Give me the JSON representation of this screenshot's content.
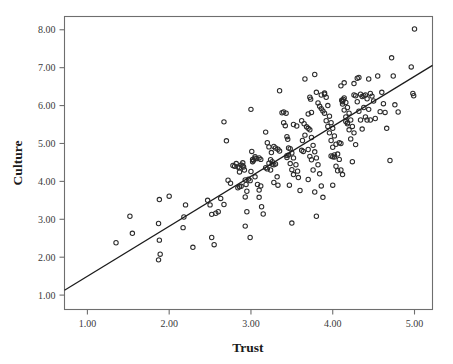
{
  "chart_data": {
    "type": "scatter",
    "title": "",
    "xlabel": "Trust",
    "ylabel": "Culture",
    "xlim": [
      0.72,
      5.22
    ],
    "ylim": [
      0.62,
      8.35
    ],
    "grid": false,
    "legend": null,
    "x_ticks": [
      "1.00",
      "2.00",
      "3.00",
      "4.00",
      "5.00"
    ],
    "x_tick_values": [
      1.0,
      2.0,
      3.0,
      4.0,
      5.0
    ],
    "y_ticks": [
      "1.00",
      "2.00",
      "3.00",
      "4.00",
      "5.00",
      "6.00",
      "7.00",
      "8.00"
    ],
    "y_tick_values": [
      1.0,
      2.0,
      3.0,
      4.0,
      5.0,
      6.0,
      7.0,
      8.0
    ],
    "marker": "open-circle",
    "marker_color": "#2b2b2b",
    "fit_line": {
      "type": "linear",
      "x_start": 0.72,
      "y_start": 1.13,
      "x_end": 5.22,
      "y_end": 7.06,
      "slope": 1.318,
      "intercept": 0.181,
      "color": "#1c1c1c"
    },
    "points": [
      [
        1.35,
        2.38
      ],
      [
        1.52,
        3.08
      ],
      [
        1.55,
        2.63
      ],
      [
        1.88,
        3.52
      ],
      [
        2.0,
        3.61
      ],
      [
        1.87,
        2.89
      ],
      [
        1.88,
        2.45
      ],
      [
        1.89,
        2.08
      ],
      [
        1.87,
        1.93
      ],
      [
        2.18,
        3.06
      ],
      [
        2.17,
        2.78
      ],
      [
        2.2,
        3.38
      ],
      [
        2.29,
        2.26
      ],
      [
        2.47,
        3.5
      ],
      [
        2.5,
        3.38
      ],
      [
        2.52,
        2.52
      ],
      [
        2.55,
        2.33
      ],
      [
        2.63,
        3.55
      ],
      [
        2.52,
        3.13
      ],
      [
        2.57,
        3.16
      ],
      [
        2.6,
        3.2
      ],
      [
        2.67,
        3.39
      ],
      [
        2.67,
        5.57
      ],
      [
        2.7,
        5.07
      ],
      [
        2.72,
        4.03
      ],
      [
        2.75,
        3.95
      ],
      [
        2.78,
        4.42
      ],
      [
        2.8,
        4.4
      ],
      [
        2.82,
        4.47
      ],
      [
        2.84,
        3.83
      ],
      [
        2.86,
        3.86
      ],
      [
        2.88,
        3.87
      ],
      [
        2.9,
        4.49
      ],
      [
        2.91,
        4.38
      ],
      [
        2.92,
        4.3
      ],
      [
        2.93,
        4.04
      ],
      [
        2.86,
        4.25
      ],
      [
        2.94,
        3.92
      ],
      [
        2.95,
        3.74
      ],
      [
        2.93,
        3.59
      ],
      [
        2.95,
        3.2
      ],
      [
        2.93,
        2.82
      ],
      [
        2.99,
        2.52
      ],
      [
        3.0,
        5.9
      ],
      [
        3.01,
        4.79
      ],
      [
        3.02,
        4.52
      ],
      [
        3.0,
        4.26
      ],
      [
        3.03,
        4.55
      ],
      [
        3.05,
        4.61
      ],
      [
        3.07,
        4.6
      ],
      [
        3.05,
        4.12
      ],
      [
        3.08,
        3.92
      ],
      [
        3.1,
        3.77
      ],
      [
        3.12,
        3.88
      ],
      [
        3.1,
        3.58
      ],
      [
        3.13,
        3.33
      ],
      [
        3.15,
        3.14
      ],
      [
        3.18,
        5.3
      ],
      [
        3.2,
        5.02
      ],
      [
        3.22,
        4.91
      ],
      [
        3.25,
        4.76
      ],
      [
        3.22,
        4.48
      ],
      [
        3.26,
        4.45
      ],
      [
        3.28,
        4.44
      ],
      [
        3.3,
        4.46
      ],
      [
        3.24,
        4.3
      ],
      [
        3.32,
        4.12
      ],
      [
        3.28,
        3.97
      ],
      [
        3.33,
        3.9
      ],
      [
        3.35,
        6.39
      ],
      [
        3.38,
        5.81
      ],
      [
        3.4,
        5.55
      ],
      [
        3.42,
        5.47
      ],
      [
        3.44,
        5.18
      ],
      [
        3.45,
        5.11
      ],
      [
        3.46,
        4.88
      ],
      [
        3.48,
        4.86
      ],
      [
        3.5,
        4.75
      ],
      [
        3.44,
        4.63
      ],
      [
        3.52,
        4.62
      ],
      [
        3.48,
        4.47
      ],
      [
        3.55,
        4.44
      ],
      [
        3.5,
        4.31
      ],
      [
        3.57,
        4.27
      ],
      [
        3.52,
        4.18
      ],
      [
        3.58,
        4.1
      ],
      [
        3.47,
        3.9
      ],
      [
        3.6,
        3.76
      ],
      [
        3.5,
        2.9
      ],
      [
        3.43,
        5.8
      ],
      [
        3.4,
        5.83
      ],
      [
        3.62,
        5.6
      ],
      [
        3.65,
        5.52
      ],
      [
        3.68,
        5.44
      ],
      [
        3.7,
        5.4
      ],
      [
        3.72,
        5.36
      ],
      [
        3.66,
        5.22
      ],
      [
        3.74,
        5.16
      ],
      [
        3.63,
        5.08
      ],
      [
        3.76,
        4.95
      ],
      [
        3.7,
        4.84
      ],
      [
        3.78,
        4.78
      ],
      [
        3.72,
        4.66
      ],
      [
        3.8,
        4.62
      ],
      [
        3.74,
        4.57
      ],
      [
        3.82,
        4.44
      ],
      [
        3.76,
        4.3
      ],
      [
        3.84,
        4.2
      ],
      [
        3.7,
        4.05
      ],
      [
        3.86,
        3.88
      ],
      [
        3.78,
        3.72
      ],
      [
        3.88,
        3.58
      ],
      [
        3.8,
        3.08
      ],
      [
        3.66,
        6.7
      ],
      [
        3.73,
        6.17
      ],
      [
        3.72,
        6.22
      ],
      [
        3.78,
        6.82
      ],
      [
        3.8,
        6.35
      ],
      [
        3.82,
        6.07
      ],
      [
        3.84,
        5.98
      ],
      [
        3.86,
        5.92
      ],
      [
        3.88,
        5.86
      ],
      [
        3.9,
        6.3
      ],
      [
        3.92,
        6.22
      ],
      [
        3.94,
        6.0
      ],
      [
        3.9,
        5.8
      ],
      [
        3.96,
        5.72
      ],
      [
        3.92,
        5.6
      ],
      [
        3.98,
        5.55
      ],
      [
        3.94,
        5.45
      ],
      [
        4.0,
        5.4
      ],
      [
        3.96,
        5.28
      ],
      [
        4.02,
        5.2
      ],
      [
        3.98,
        5.08
      ],
      [
        4.04,
        4.98
      ],
      [
        4.0,
        4.9
      ],
      [
        4.06,
        4.72
      ],
      [
        4.02,
        4.64
      ],
      [
        4.08,
        4.58
      ],
      [
        4.04,
        4.4
      ],
      [
        4.1,
        4.3
      ],
      [
        4.06,
        4.28
      ],
      [
        4.12,
        4.18
      ],
      [
        4.0,
        3.9
      ],
      [
        3.98,
        4.67
      ],
      [
        4.0,
        4.65
      ],
      [
        4.02,
        4.7
      ],
      [
        4.14,
        6.6
      ],
      [
        4.1,
        6.52
      ],
      [
        4.16,
        6.08
      ],
      [
        4.12,
        6.12
      ],
      [
        4.13,
        6.16
      ],
      [
        4.14,
        6.2
      ],
      [
        4.12,
        6.04
      ],
      [
        4.18,
        5.95
      ],
      [
        4.14,
        5.88
      ],
      [
        4.2,
        5.8
      ],
      [
        4.16,
        5.7
      ],
      [
        4.22,
        5.62
      ],
      [
        4.18,
        5.52
      ],
      [
        4.24,
        5.45
      ],
      [
        4.2,
        5.36
      ],
      [
        4.26,
        5.28
      ],
      [
        4.22,
        5.12
      ],
      [
        4.28,
        4.97
      ],
      [
        4.24,
        4.52
      ],
      [
        4.3,
        6.72
      ],
      [
        4.32,
        6.74
      ],
      [
        4.26,
        6.58
      ],
      [
        4.34,
        6.3
      ],
      [
        4.36,
        6.24
      ],
      [
        4.3,
        6.1
      ],
      [
        4.38,
        5.95
      ],
      [
        4.32,
        5.85
      ],
      [
        4.4,
        5.7
      ],
      [
        4.34,
        5.62
      ],
      [
        4.42,
        5.62
      ],
      [
        4.36,
        5.38
      ],
      [
        4.44,
        6.7
      ],
      [
        4.46,
        6.32
      ],
      [
        4.48,
        6.25
      ],
      [
        4.42,
        6.18
      ],
      [
        4.5,
        6.12
      ],
      [
        4.44,
        5.9
      ],
      [
        4.52,
        5.66
      ],
      [
        4.46,
        5.62
      ],
      [
        4.55,
        6.78
      ],
      [
        4.6,
        6.35
      ],
      [
        4.62,
        6.05
      ],
      [
        4.58,
        5.84
      ],
      [
        4.64,
        5.82
      ],
      [
        4.66,
        5.4
      ],
      [
        4.7,
        4.55
      ],
      [
        4.72,
        7.26
      ],
      [
        4.74,
        6.78
      ],
      [
        4.76,
        6.02
      ],
      [
        4.8,
        5.83
      ],
      [
        4.96,
        7.02
      ],
      [
        4.98,
        6.32
      ],
      [
        4.99,
        6.26
      ],
      [
        5.0,
        8.02
      ],
      [
        3.33,
        4.85
      ],
      [
        3.35,
        4.8
      ],
      [
        3.3,
        4.88
      ],
      [
        3.28,
        4.92
      ],
      [
        2.88,
        4.43
      ],
      [
        2.9,
        4.41
      ],
      [
        3.44,
        4.68
      ],
      [
        3.46,
        4.7
      ],
      [
        4.08,
        5.02
      ],
      [
        4.1,
        5.0
      ],
      [
        3.62,
        4.82
      ],
      [
        3.64,
        4.79
      ],
      [
        2.97,
        4.06
      ],
      [
        2.99,
        4.02
      ],
      [
        3.52,
        5.5
      ],
      [
        3.56,
        5.46
      ],
      [
        4.26,
        6.28
      ],
      [
        4.28,
        6.26
      ],
      [
        3.86,
        6.28
      ],
      [
        3.9,
        6.33
      ],
      [
        4.12,
        6.1
      ],
      [
        4.11,
        6.14
      ],
      [
        3.18,
        4.36
      ],
      [
        3.2,
        4.33
      ],
      [
        2.84,
        4.38
      ],
      [
        2.86,
        4.36
      ],
      [
        3.74,
        5.82
      ],
      [
        3.7,
        5.78
      ],
      [
        4.4,
        6.28
      ],
      [
        4.38,
        6.26
      ],
      [
        3.26,
        4.52
      ],
      [
        3.24,
        4.57
      ],
      [
        4.16,
        5.58
      ],
      [
        4.18,
        5.55
      ],
      [
        3.12,
        4.58
      ],
      [
        3.1,
        4.62
      ],
      [
        3.05,
        4.65
      ],
      [
        3.02,
        4.58
      ]
    ]
  }
}
